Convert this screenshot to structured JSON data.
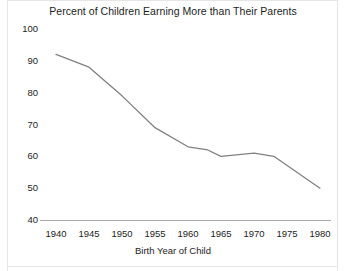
{
  "chart_data": {
    "type": "line",
    "title": "Percent of Children Earning More than Their Parents",
    "xlabel": "Birth Year of Child",
    "ylabel": "",
    "x": [
      1940,
      1945,
      1950,
      1955,
      1960,
      1963,
      1965,
      1970,
      1973,
      1980
    ],
    "values": [
      92,
      88,
      79,
      69,
      63,
      62,
      60,
      61,
      60,
      50
    ],
    "series": [
      {
        "name": "Percent of children earning more than their parents",
        "values": [
          92,
          88,
          79,
          69,
          63,
          62,
          60,
          61,
          60,
          50
        ]
      }
    ],
    "xlim": [
      1940,
      1980
    ],
    "ylim": [
      40,
      100
    ],
    "xticks": [
      "1940",
      "1945",
      "1950",
      "1955",
      "1960",
      "1965",
      "1970",
      "1975",
      "1980"
    ],
    "yticks": [
      "100",
      "90",
      "80",
      "70",
      "60",
      "50",
      "40"
    ],
    "grid": false,
    "legend": "none",
    "line_color": "#808080"
  },
  "axes": {
    "y_ticks": [
      "100",
      "90",
      "80",
      "70",
      "60",
      "50",
      "40"
    ],
    "x_ticks": [
      "1940",
      "1945",
      "1950",
      "1955",
      "1960",
      "1965",
      "1970",
      "1975",
      "1980"
    ],
    "x_title": "Birth Year of Child"
  },
  "title": "Percent of Children Earning More than Their Parents"
}
